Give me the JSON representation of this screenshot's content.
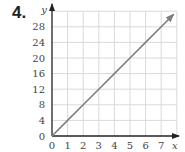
{
  "problem": {
    "number": "4."
  },
  "chart_data": {
    "type": "line",
    "title": "",
    "xlabel": "x",
    "ylabel": "y",
    "xlim": [
      0,
      8
    ],
    "ylim": [
      0,
      32
    ],
    "grid": true,
    "x_ticks": [
      "0",
      "1",
      "2",
      "3",
      "4",
      "5",
      "6",
      "7"
    ],
    "y_ticks": [
      "0",
      "4",
      "8",
      "12",
      "16",
      "20",
      "24",
      "28"
    ],
    "series": [
      {
        "name": "y = 4x",
        "x": [
          0,
          1,
          2,
          3,
          4,
          5,
          6,
          7,
          7.8
        ],
        "values": [
          0,
          4,
          8,
          12,
          16,
          20,
          24,
          28,
          31.2
        ],
        "color": "#808080",
        "arrow_end": true
      }
    ]
  },
  "colors": {
    "grid": "#d9d9d9",
    "axis": "#222222",
    "line": "#808080"
  }
}
